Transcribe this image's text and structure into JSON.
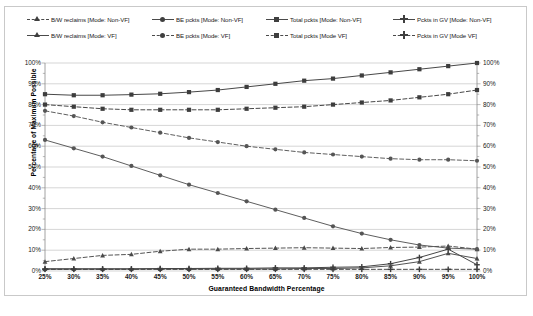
{
  "chart_data": {
    "type": "line",
    "title": "",
    "xlabel": "Guaranteed Bandwidth Percentage",
    "ylabel": "Percentage of Maximum Possible",
    "ylabel_right": "Percentage of Maximum Possible",
    "ylim": [
      0,
      100
    ],
    "ytick_labels": [
      "100%",
      "90%",
      "80%",
      "70%",
      "60%",
      "50%",
      "40%",
      "30%",
      "20%",
      "10%",
      "0%"
    ],
    "ytick_values": [
      100,
      90,
      80,
      70,
      60,
      50,
      40,
      30,
      20,
      10,
      0
    ],
    "grid": true,
    "legend_position": "top",
    "categories": [
      "25%",
      "30%",
      "35%",
      "40%",
      "45%",
      "50%",
      "55%",
      "60%",
      "65%",
      "70%",
      "75%",
      "80%",
      "85%",
      "90%",
      "95%",
      "100%"
    ],
    "x_values": [
      25,
      30,
      35,
      40,
      45,
      50,
      55,
      60,
      65,
      70,
      75,
      80,
      85,
      90,
      95,
      100
    ],
    "series": [
      {
        "name": "B/W reclaims [Mode: Non-VF]",
        "mode": "Non-VF",
        "metric": "B/W reclaims",
        "marker": "triangle",
        "line": "dashed",
        "color": "#4a4a4a",
        "values": [
          4.5,
          6.0,
          7.5,
          8.0,
          9.5,
          10.5,
          10.5,
          10.8,
          11.0,
          11.2,
          11.0,
          10.8,
          11.3,
          11.5,
          12.0,
          10.5
        ]
      },
      {
        "name": "BE pckts [Mode: Non-VF]",
        "mode": "Non-VF",
        "metric": "BE pckts",
        "marker": "circle",
        "line": "solid",
        "color": "#555555",
        "values": [
          63.0,
          59.0,
          55.0,
          50.5,
          46.0,
          41.5,
          37.5,
          33.5,
          29.5,
          25.5,
          21.5,
          18.0,
          15.0,
          12.5,
          11.0,
          10.5
        ]
      },
      {
        "name": "Total pckts [Mode: Non-VF]",
        "mode": "Non-VF",
        "metric": "Total pckts",
        "marker": "square",
        "line": "solid",
        "color": "#3d3d3d",
        "values": [
          85.0,
          84.5,
          84.5,
          84.8,
          85.2,
          86.0,
          87.0,
          88.5,
          90.0,
          91.5,
          92.5,
          94.0,
          95.5,
          97.0,
          98.5,
          100.0
        ]
      },
      {
        "name": "Pckts in GV [Mode: Non-VF]",
        "mode": "Non-VF",
        "metric": "Pckts in GV",
        "marker": "plus",
        "line": "solid",
        "color": "#3d3d3d",
        "values": [
          1.0,
          1.0,
          1.0,
          1.0,
          1.2,
          1.2,
          1.3,
          1.3,
          1.5,
          1.5,
          1.8,
          2.0,
          3.5,
          6.5,
          10.5,
          3.0
        ]
      },
      {
        "name": "B/W reclaims [Mode: VF]",
        "mode": "VF",
        "metric": "B/W reclaims",
        "marker": "triangle",
        "line": "solid",
        "color": "#4a4a4a",
        "values": [
          1.0,
          1.0,
          1.0,
          1.0,
          1.0,
          1.0,
          1.0,
          1.0,
          1.0,
          1.2,
          1.2,
          1.5,
          2.5,
          4.5,
          8.5,
          6.0
        ]
      },
      {
        "name": "BE pckts [Mode: VF]",
        "mode": "VF",
        "metric": "BE pckts",
        "marker": "circle",
        "line": "dashed",
        "color": "#555555",
        "values": [
          77.0,
          74.5,
          71.5,
          69.0,
          66.5,
          64.0,
          62.0,
          60.0,
          58.5,
          57.0,
          56.0,
          55.0,
          54.0,
          53.5,
          53.5,
          53.0
        ]
      },
      {
        "name": "Total pckts [Mode VF]",
        "mode": "VF",
        "metric": "Total pckts",
        "marker": "square",
        "line": "dashed",
        "color": "#3d3d3d",
        "values": [
          80.0,
          79.0,
          78.0,
          77.5,
          77.5,
          77.5,
          77.5,
          78.0,
          78.5,
          79.0,
          80.0,
          81.0,
          82.0,
          83.5,
          85.0,
          87.0
        ]
      },
      {
        "name": "Pckts in GV [Mode VF]",
        "mode": "VF",
        "metric": "Pckts in GV",
        "marker": "plus",
        "line": "dashed",
        "color": "#3d3d3d",
        "values": [
          0.8,
          0.8,
          0.8,
          0.8,
          0.8,
          0.8,
          0.8,
          0.8,
          0.8,
          0.8,
          0.8,
          0.8,
          0.8,
          0.8,
          0.8,
          0.8
        ]
      }
    ]
  },
  "legend": {
    "row1": [
      {
        "label": "B/W reclaims [Mode: Non-VF]",
        "marker": "triangle",
        "line": "dashed"
      },
      {
        "label": "BE pckts [Mode: Non-VF]",
        "marker": "circle",
        "line": "solid"
      },
      {
        "label": "Total pckts [Mode: Non-VF]",
        "marker": "square",
        "line": "solid"
      },
      {
        "label": "Pckts in GV [Mode: Non-VF]",
        "marker": "plus",
        "line": "solid"
      }
    ],
    "row2": [
      {
        "label": "B/W reclaims [Mode: VF]",
        "marker": "triangle",
        "line": "solid"
      },
      {
        "label": "BE pckts [Mode: VF]",
        "marker": "circle",
        "line": "dashed"
      },
      {
        "label": "Total pckts [Mode VF]",
        "marker": "square",
        "line": "dashed"
      },
      {
        "label": "Pckts in GV [Mode VF]",
        "marker": "plus",
        "line": "dashed"
      }
    ]
  },
  "caption": ""
}
